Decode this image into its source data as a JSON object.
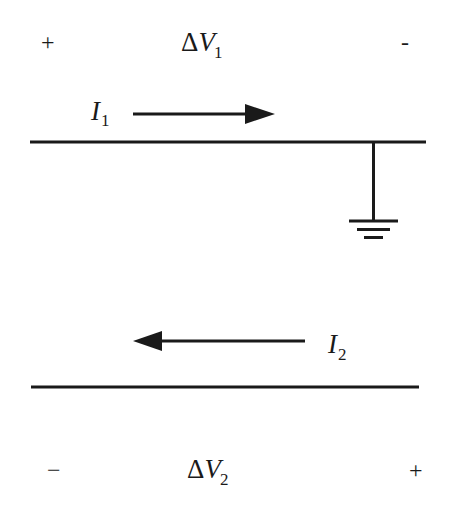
{
  "diagram": {
    "type": "two-wire transmission line with ground reference",
    "top_line": {
      "voltage_label": {
        "symbol": "V",
        "prefix": "Δ",
        "subscript": "1"
      },
      "left_sign": "+",
      "right_sign": "-",
      "current_label": {
        "symbol": "I",
        "subscript": "1"
      },
      "current_direction": "right",
      "grounded": true,
      "ground_position": "right end"
    },
    "bottom_line": {
      "voltage_label": {
        "symbol": "V",
        "prefix": "Δ",
        "subscript": "2"
      },
      "left_sign": "−",
      "right_sign": "+",
      "current_label": {
        "symbol": "I",
        "subscript": "2"
      },
      "current_direction": "left",
      "grounded": false
    },
    "colors": {
      "ink": "#1a1a1a",
      "background": "#ffffff"
    }
  }
}
